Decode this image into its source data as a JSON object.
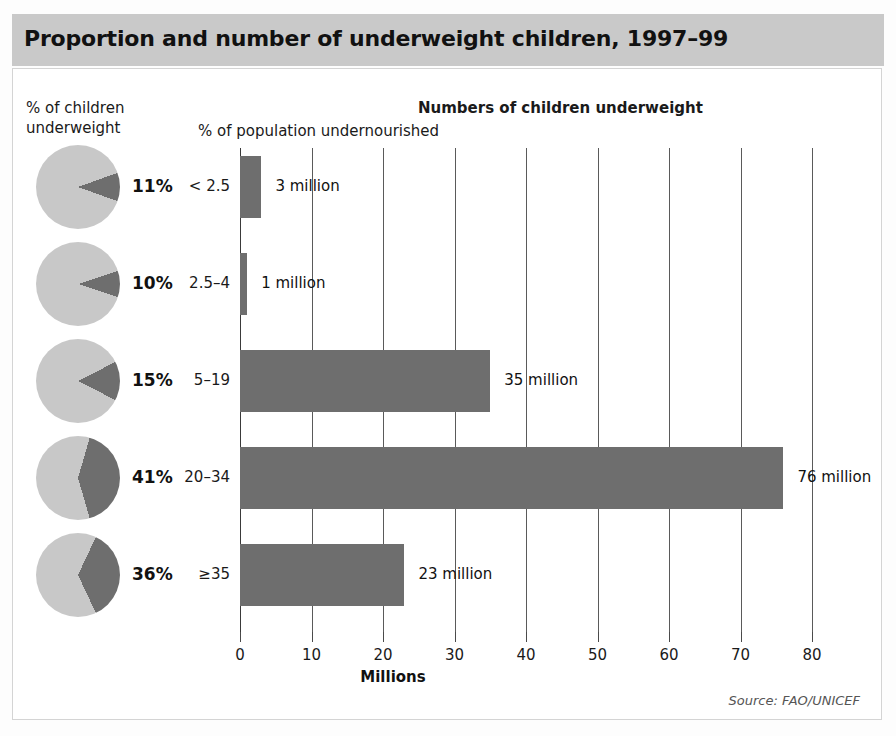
{
  "title": "Proportion and number of underweight children, 1997–99",
  "headings": {
    "pie_column": "% of children\nunderweight",
    "pie_column_line1": "% of children",
    "pie_column_line2": "underweight",
    "bars_column": "Numbers of children underweight",
    "category_column": "% of population undernourished"
  },
  "source": "Source: FAO/UNICEF",
  "colors": {
    "bar_fill": "#6e6e6e",
    "pie_slice": "#6e6e6e",
    "pie_rest": "#c8c8c8",
    "header_band": "#c9c9c9",
    "gridline": "#5a5a5a",
    "text": "#111111"
  },
  "chart_data": {
    "type": "bar",
    "title": "Proportion and number of underweight children, 1997–99",
    "subtitle": "Numbers of children underweight",
    "xlabel": "Millions",
    "ylabel": "% of population undernourished",
    "orientation": "horizontal",
    "xlim": [
      0,
      80
    ],
    "xticks": [
      0,
      10,
      20,
      30,
      40,
      50,
      60,
      70,
      80
    ],
    "xticklabels": [
      "0",
      "10",
      "20",
      "30",
      "40",
      "50",
      "60",
      "70",
      "80"
    ],
    "grid": true,
    "legend": "none",
    "categories": [
      "< 2.5",
      "2.5–4",
      "5–19",
      "20–34",
      "≥35"
    ],
    "values": [
      3,
      1,
      35,
      76,
      23
    ],
    "value_labels": [
      "3 million",
      "1 million",
      "35 million",
      "76 million",
      "23 million"
    ],
    "pie_series": {
      "name": "% of children underweight",
      "values": [
        11,
        10,
        15,
        41,
        36
      ],
      "labels": [
        "11%",
        "10%",
        "15%",
        "41%",
        "36%"
      ]
    }
  },
  "rows": [
    {
      "category": "< 2.5",
      "pie_pct": 11,
      "pie_label": "11%",
      "millions": 3,
      "value_label": "3 million"
    },
    {
      "category": "2.5–4",
      "pie_pct": 10,
      "pie_label": "10%",
      "millions": 1,
      "value_label": "1 million"
    },
    {
      "category": "5–19",
      "pie_pct": 15,
      "pie_label": "15%",
      "millions": 35,
      "value_label": "35 million"
    },
    {
      "category": "20–34",
      "pie_pct": 41,
      "pie_label": "41%",
      "millions": 76,
      "value_label": "76 million"
    },
    {
      "category": "≥35",
      "pie_pct": 36,
      "pie_label": "36%",
      "millions": 23,
      "value_label": "23 million"
    }
  ]
}
